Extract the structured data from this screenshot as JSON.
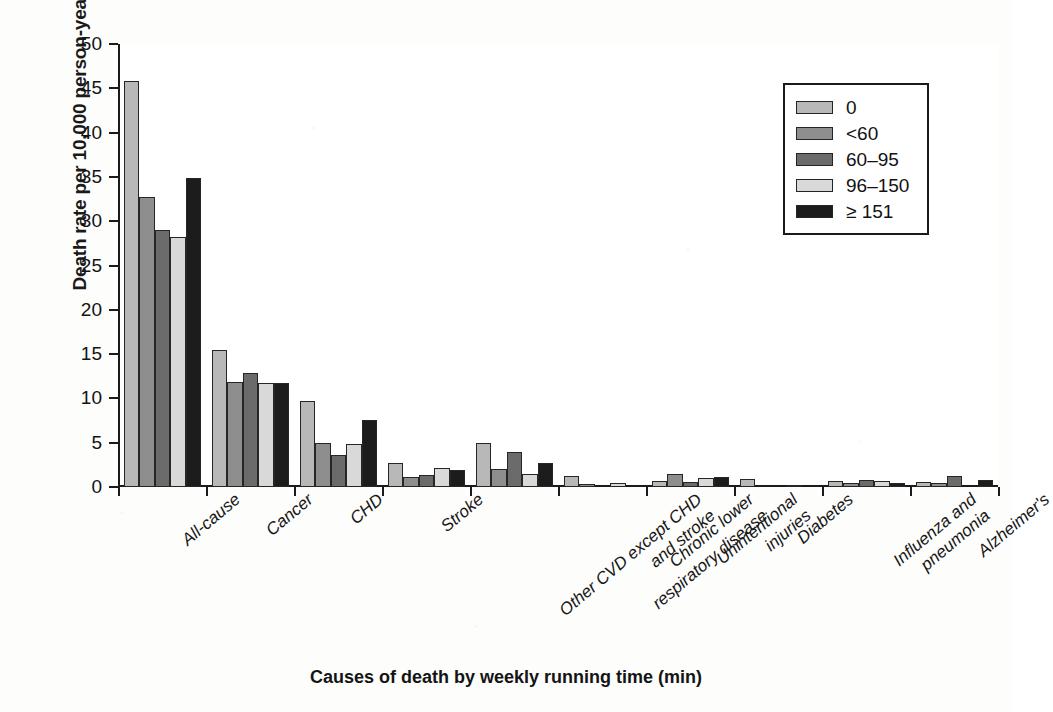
{
  "chart_data": {
    "type": "bar",
    "title": "",
    "xlabel": "Causes of death by weekly running time (min)",
    "ylabel": "Death rate per 10,000 person-years",
    "ylim": [
      0,
      50
    ],
    "yticks": [
      0,
      5,
      10,
      15,
      20,
      25,
      30,
      35,
      40,
      45,
      50
    ],
    "ytick_labels": [
      "0",
      "5",
      "10",
      "15",
      "20",
      "25",
      "30",
      "35",
      "40",
      "45",
      "50"
    ],
    "grid": false,
    "legend_position": "top-right",
    "categories": [
      "All-cause",
      "Cancer",
      "CHD",
      "Stroke",
      "Other CVD except CHD and stroke",
      "Chronic lower respiratory disease",
      "Unintentional injuries",
      "Diabetes",
      "Influenza and pneumonia",
      "Alzheimer's"
    ],
    "category_lines": [
      [
        "All-cause"
      ],
      [
        "Cancer"
      ],
      [
        "CHD"
      ],
      [
        "Stroke"
      ],
      [
        "Other CVD except CHD",
        "and stroke"
      ],
      [
        "Chronic lower",
        "respiratory disease"
      ],
      [
        "Unintentional",
        "injuries"
      ],
      [
        "Diabetes"
      ],
      [
        "Influenza and",
        "pneumonia"
      ],
      [
        "Alzheimer's"
      ]
    ],
    "series": [
      {
        "name": "0",
        "color": "#b8b8b8",
        "values": [
          45.8,
          15.5,
          9.7,
          2.7,
          5.0,
          1.2,
          0.7,
          0.9,
          0.7,
          0.6
        ]
      },
      {
        "name": "<60",
        "color": "#8e8e8e",
        "values": [
          32.7,
          11.8,
          5.0,
          1.1,
          2.0,
          0.3,
          1.5,
          0.0,
          0.4,
          0.4
        ]
      },
      {
        "name": "60–95",
        "color": "#6b6b6b",
        "values": [
          29.0,
          12.9,
          3.6,
          1.4,
          3.9,
          0.0,
          0.6,
          0.0,
          0.8,
          1.2
        ]
      },
      {
        "name": "96–150",
        "color": "#d9d9d9",
        "values": [
          28.2,
          11.7,
          4.9,
          2.1,
          1.5,
          0.4,
          1.0,
          0.2,
          0.7,
          0.0
        ]
      },
      {
        "name": "≥ 151",
        "color": "#1c1c1c",
        "values": [
          34.9,
          11.7,
          7.6,
          1.9,
          2.7,
          0.0,
          1.1,
          0.0,
          0.4,
          0.8
        ]
      }
    ]
  },
  "legend": {
    "items": [
      {
        "label": "0",
        "color": "#b8b8b8"
      },
      {
        "label": "<60",
        "color": "#8e8e8e"
      },
      {
        "label": "60–95",
        "color": "#6b6b6b"
      },
      {
        "label": "96–150",
        "color": "#d9d9d9"
      },
      {
        "label": "≥ 151",
        "color": "#1c1c1c"
      }
    ]
  }
}
